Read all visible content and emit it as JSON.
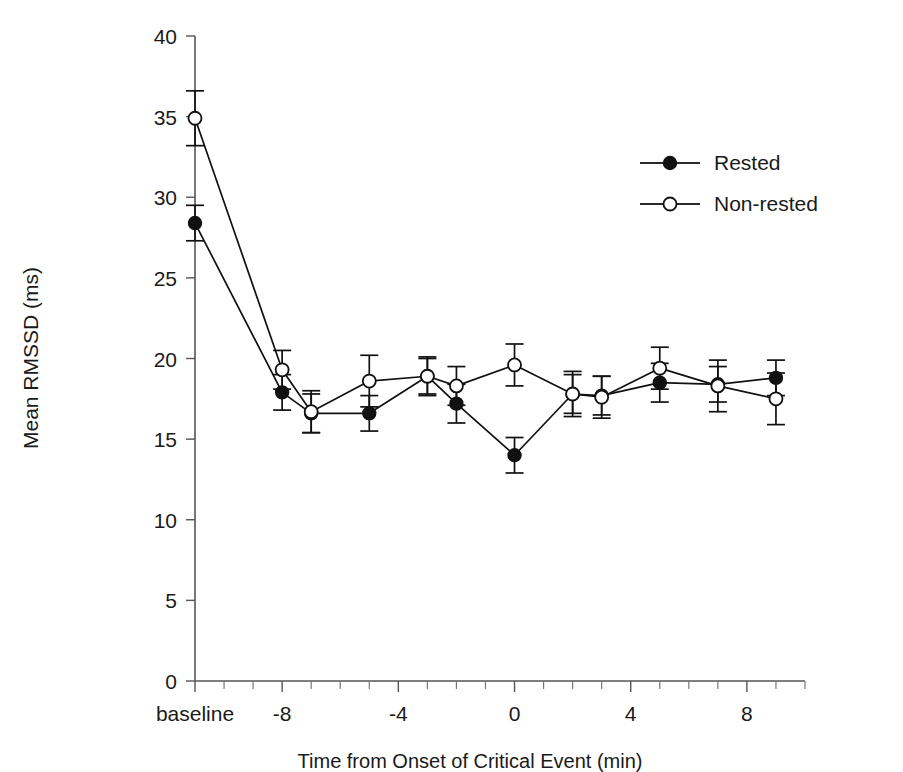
{
  "chart_data": {
    "type": "line",
    "title": "",
    "xlabel": "Time from Onset of Critical Event (min)",
    "ylabel": "Mean RMSSD (ms)",
    "ylim": [
      0,
      40
    ],
    "yticks": [
      0,
      5,
      10,
      15,
      20,
      25,
      30,
      35,
      40
    ],
    "ytick_labels": [
      "0",
      "5",
      "10",
      "15",
      "20",
      "25",
      "30",
      "35",
      "40"
    ],
    "x": [
      "baseline",
      -10,
      -9,
      -8,
      -7,
      -6,
      -5,
      -4,
      -3,
      -2,
      -1,
      0,
      1,
      2,
      3,
      4,
      5,
      6,
      7,
      8,
      9,
      10
    ],
    "xtick_labels": [
      "baseline",
      "",
      "",
      "-8",
      "",
      "",
      "",
      "-4",
      "",
      "",
      "",
      "0",
      "",
      "",
      "",
      "4",
      "",
      "",
      "",
      "8",
      "",
      ""
    ],
    "categories": [
      "baseline",
      "-8",
      "-4",
      "0",
      "4",
      "8"
    ],
    "grid": false,
    "legend_position": "upper right",
    "series": [
      {
        "name": "Rested",
        "marker": "filled-circle",
        "x": [
          "baseline",
          -8,
          -7,
          -5,
          -3,
          -2,
          0,
          2,
          3,
          5,
          7,
          9
        ],
        "values": [
          28.4,
          17.9,
          16.6,
          16.6,
          18.9,
          17.2,
          14.0,
          17.8,
          17.7,
          18.5,
          18.4,
          18.8
        ],
        "errors": [
          1.1,
          1.1,
          1.2,
          1.1,
          1.1,
          1.2,
          1.1,
          1.2,
          1.2,
          1.2,
          1.1,
          1.1
        ]
      },
      {
        "name": "Non-rested",
        "marker": "open-circle",
        "x": [
          "baseline",
          -8,
          -7,
          -5,
          -3,
          -2,
          0,
          2,
          3,
          5,
          7,
          9
        ],
        "values": [
          34.9,
          19.3,
          16.7,
          18.6,
          18.9,
          18.3,
          19.6,
          17.8,
          17.6,
          19.4,
          18.3,
          17.5
        ],
        "errors": [
          1.7,
          1.2,
          1.3,
          1.6,
          1.2,
          1.2,
          1.3,
          1.4,
          1.3,
          1.3,
          1.6,
          1.6
        ]
      }
    ],
    "legend": [
      {
        "label": "Rested",
        "marker": "filled-circle"
      },
      {
        "label": "Non-rested",
        "marker": "open-circle"
      }
    ]
  },
  "axes": {
    "y_title": "Mean RMSSD (ms)",
    "x_caption": "Time from Onset of Critical Event (min)"
  },
  "colors": {
    "line": "#111111",
    "axis": "#555555",
    "text": "#1a1a1a",
    "background": "#ffffff"
  }
}
